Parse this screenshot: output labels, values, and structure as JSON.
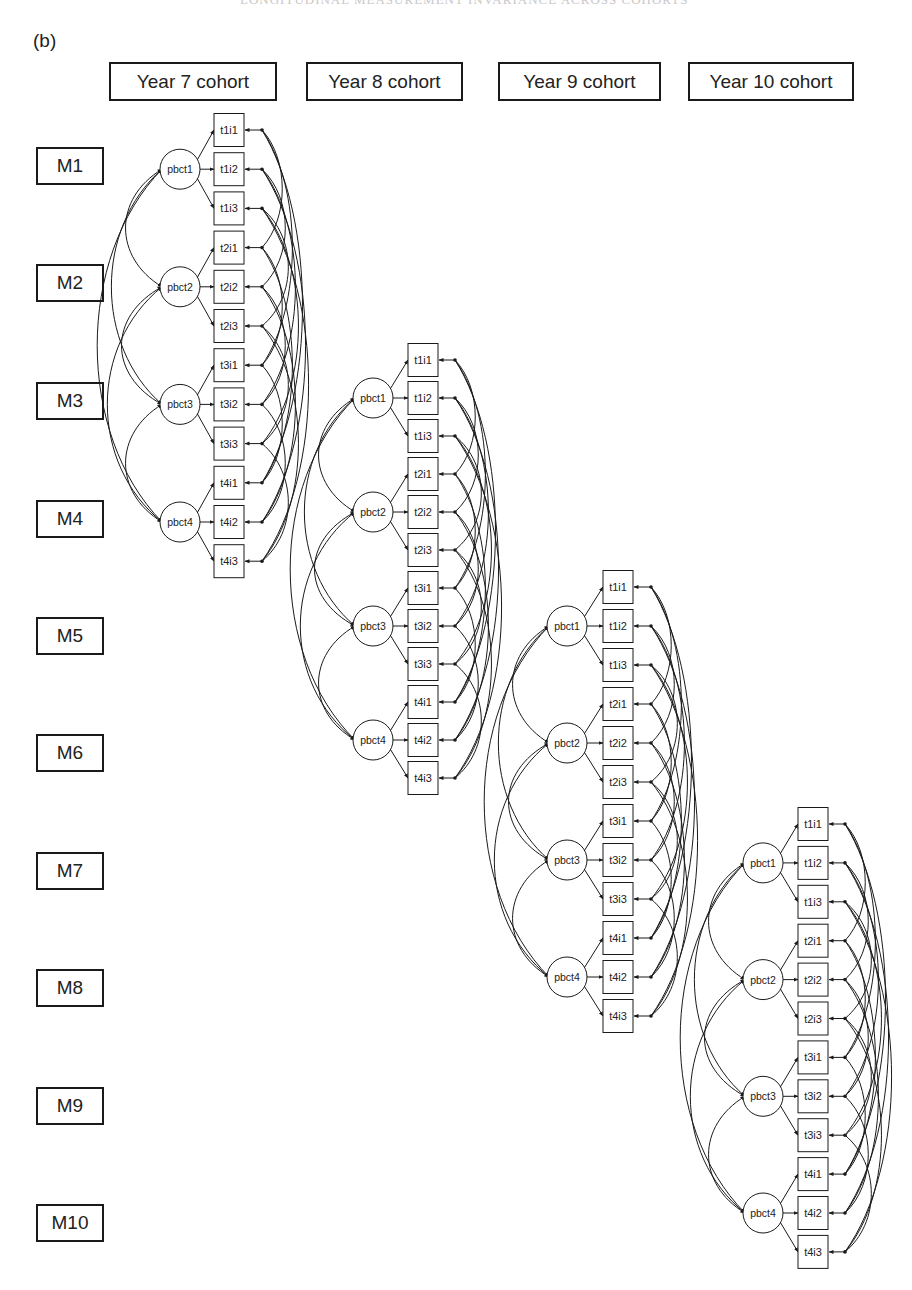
{
  "panel_label": "(b)",
  "cohort_headers": [
    {
      "label": "Year 7 cohort",
      "x": 109,
      "w": 168
    },
    {
      "label": "Year 8 cohort",
      "x": 306,
      "w": 157
    },
    {
      "label": "Year 9 cohort",
      "x": 498,
      "w": 163
    },
    {
      "label": "Year 10 cohort",
      "x": 688,
      "w": 166
    }
  ],
  "measurement_waves": [
    {
      "label": "M1",
      "y": 147
    },
    {
      "label": "M2",
      "y": 264
    },
    {
      "label": "M3",
      "y": 382
    },
    {
      "label": "M4",
      "y": 500
    },
    {
      "label": "M5",
      "y": 617
    },
    {
      "label": "M6",
      "y": 734
    },
    {
      "label": "M7",
      "y": 852
    },
    {
      "label": "M8",
      "y": 969
    },
    {
      "label": "M9",
      "y": 1087
    },
    {
      "label": "M10",
      "y": 1204
    }
  ],
  "chart_data": {
    "type": "diagram",
    "title": "(b)",
    "latent_factors": [
      "pbct1",
      "pbct2",
      "pbct3",
      "pbct4"
    ],
    "indicators": [
      [
        "t1i1",
        "t1i2",
        "t1i3"
      ],
      [
        "t2i1",
        "t2i2",
        "t2i3"
      ],
      [
        "t3i1",
        "t3i2",
        "t3i3"
      ],
      [
        "t4i1",
        "t4i2",
        "t4i3"
      ]
    ],
    "models": [
      {
        "cohort": "Year 7 cohort",
        "waves": [
          "M1",
          "M2",
          "M3",
          "M4"
        ],
        "origin_x": 180,
        "first_item_y": 130,
        "step": 39.2,
        "box_x": 214,
        "dot_x": 262
      },
      {
        "cohort": "Year 8 cohort",
        "waves": [
          "M3",
          "M4",
          "M5",
          "M6"
        ],
        "origin_x": 373,
        "first_item_y": 360,
        "step": 38.0,
        "box_x": 408,
        "dot_x": 455
      },
      {
        "cohort": "Year 9 cohort",
        "waves": [
          "M5",
          "M6",
          "M7",
          "M8"
        ],
        "origin_x": 567,
        "first_item_y": 587,
        "step": 39.0,
        "box_x": 603,
        "dot_x": 651
      },
      {
        "cohort": "Year 10 cohort",
        "waves": [
          "M7",
          "M8",
          "M9",
          "M10"
        ],
        "origin_x": 763,
        "first_item_y": 824,
        "step": 38.9,
        "box_x": 798,
        "dot_x": 845
      }
    ],
    "paths": {
      "loadings": "each pbctT -> tTi1, tTi2, tTi3",
      "factor_covariances": "all pairs among pbct1..pbct4",
      "residual_covariances": "tAiK <-> tBiK for all time pairs A<B, per item K"
    }
  }
}
